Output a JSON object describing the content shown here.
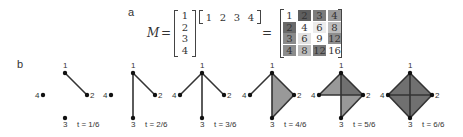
{
  "panel_a": {
    "label": "a",
    "lhs": "M",
    "equals1": "=",
    "equals2": "=",
    "column_vector": [
      "1",
      "2",
      "3",
      "4"
    ],
    "row_vector": [
      "1",
      "2",
      "3",
      "4"
    ],
    "result_matrix": [
      [
        {
          "v": "1",
          "shade": "#ffffff"
        },
        {
          "v": "2",
          "shade": "#5e5e5e"
        },
        {
          "v": "3",
          "shade": "#7c7c7c"
        },
        {
          "v": "4",
          "shade": "#9a9a9a"
        }
      ],
      [
        {
          "v": "2",
          "shade": "#6a6a6a"
        },
        {
          "v": "4",
          "shade": "#ffffff"
        },
        {
          "v": "6",
          "shade": "#ececec"
        },
        {
          "v": "8",
          "shade": "#bdbdbd"
        }
      ],
      [
        {
          "v": "3",
          "shade": "#8a8a8a"
        },
        {
          "v": "6",
          "shade": "#e2e2e2"
        },
        {
          "v": "9",
          "shade": "#ffffff"
        },
        {
          "v": "12",
          "shade": "#8e8e8e"
        }
      ],
      [
        {
          "v": "4",
          "shade": "#8c8c8c"
        },
        {
          "v": "8",
          "shade": "#bcbcbc"
        },
        {
          "v": "12",
          "shade": "#7a7a7a"
        },
        {
          "v": "16",
          "shade": "#ffffff"
        }
      ]
    ]
  },
  "panel_b": {
    "label": "b",
    "node_labels": [
      "1",
      "2",
      "3",
      "4"
    ],
    "steps": [
      {
        "t": "t = 1/6",
        "edges": [
          [
            "1",
            "2"
          ]
        ],
        "triangles": []
      },
      {
        "t": "t = 2/6",
        "edges": [
          [
            "1",
            "2"
          ],
          [
            "1",
            "3"
          ]
        ],
        "triangles": []
      },
      {
        "t": "t = 3/6",
        "edges": [
          [
            "1",
            "2"
          ],
          [
            "1",
            "3"
          ],
          [
            "1",
            "4"
          ]
        ],
        "triangles": []
      },
      {
        "t": "t = 4/6",
        "edges": [
          [
            "1",
            "2"
          ],
          [
            "1",
            "3"
          ],
          [
            "1",
            "4"
          ],
          [
            "2",
            "3"
          ]
        ],
        "triangles": [
          [
            "1",
            "2",
            "3"
          ]
        ]
      },
      {
        "t": "t = 5/6",
        "edges": [
          [
            "1",
            "2"
          ],
          [
            "1",
            "3"
          ],
          [
            "1",
            "4"
          ],
          [
            "2",
            "3"
          ],
          [
            "2",
            "4"
          ]
        ],
        "triangles": [
          [
            "1",
            "2",
            "3"
          ],
          [
            "1",
            "2",
            "4"
          ]
        ]
      },
      {
        "t": "t = 6/6",
        "edges": [
          [
            "1",
            "2"
          ],
          [
            "1",
            "3"
          ],
          [
            "1",
            "4"
          ],
          [
            "2",
            "3"
          ],
          [
            "2",
            "4"
          ],
          [
            "3",
            "4"
          ]
        ],
        "triangles": [
          [
            "1",
            "2",
            "3"
          ],
          [
            "1",
            "2",
            "4"
          ],
          [
            "1",
            "3",
            "4"
          ],
          [
            "2",
            "3",
            "4"
          ]
        ]
      }
    ]
  }
}
